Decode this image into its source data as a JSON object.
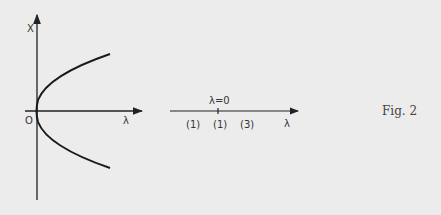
{
  "colors": {
    "background": "#ececec",
    "ink": "#222222"
  },
  "left_graph": {
    "y_axis_label": "X",
    "x_axis_label": "λ",
    "origin_label": "O",
    "curve": "parabola opening right, vertex at origin (x² ∝ λ)"
  },
  "number_line": {
    "tick_label": "λ=0",
    "axis_label": "λ",
    "region_labels": [
      "(1)",
      "(1)",
      "(3)"
    ]
  },
  "caption": "Fig. 2"
}
